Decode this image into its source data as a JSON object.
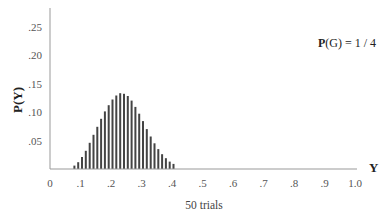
{
  "chart_data": {
    "type": "bar",
    "title": "",
    "annotation": {
      "bold": "P",
      "rest": "(G) = 1 / 4"
    },
    "caption": "50 trials",
    "xlabel": "Y",
    "ylabel": "P(Y)",
    "xlim": [
      0,
      1.0
    ],
    "ylim": [
      0,
      0.28
    ],
    "grid": false,
    "legend": null,
    "x_ticks": [
      "0",
      ".1",
      ".2",
      ".3",
      ".4",
      ".5",
      ".6",
      ".7",
      ".8",
      ".9",
      "1.0"
    ],
    "x_tick_values": [
      0,
      0.1,
      0.2,
      0.3,
      0.4,
      0.5,
      0.6,
      0.7,
      0.8,
      0.9,
      1.0
    ],
    "y_ticks": [
      ".05",
      ".10",
      ".15",
      ".20",
      ".25"
    ],
    "y_tick_values": [
      0.05,
      0.1,
      0.15,
      0.2,
      0.25
    ],
    "x": [
      0.08,
      0.0925,
      0.105,
      0.1175,
      0.13,
      0.1425,
      0.155,
      0.1675,
      0.18,
      0.1925,
      0.205,
      0.2175,
      0.23,
      0.2425,
      0.255,
      0.2675,
      0.28,
      0.2925,
      0.305,
      0.3175,
      0.33,
      0.3425,
      0.355,
      0.3675,
      0.38,
      0.3925,
      0.405
    ],
    "values": [
      0.006,
      0.012,
      0.021,
      0.032,
      0.046,
      0.06,
      0.074,
      0.088,
      0.101,
      0.112,
      0.122,
      0.129,
      0.133,
      0.132,
      0.128,
      0.12,
      0.109,
      0.097,
      0.084,
      0.07,
      0.057,
      0.045,
      0.035,
      0.026,
      0.019,
      0.013,
      0.009
    ],
    "bar_color": "#444444",
    "axis_color": "#999999"
  }
}
